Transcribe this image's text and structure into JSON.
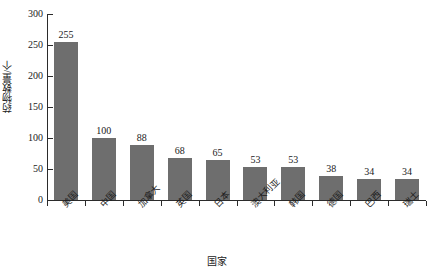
{
  "chart_data": {
    "type": "bar",
    "title": "",
    "xlabel": "国家",
    "ylabel": "药物数量/个",
    "categories": [
      "美国",
      "中国",
      "加拿大",
      "英国",
      "日本",
      "澳大利亚",
      "韩国",
      "德国",
      "巴西",
      "瑞士"
    ],
    "values": [
      255,
      100,
      88,
      68,
      65,
      53,
      53,
      38,
      34,
      34
    ],
    "ylim": [
      0,
      300
    ],
    "yticks": [
      0,
      50,
      100,
      150,
      200,
      250,
      300
    ],
    "ytick_labels": [
      "0",
      "50",
      "100",
      "150",
      "200",
      "250",
      "300"
    ],
    "grid": false,
    "legend": null,
    "bar_color": "#6e6e6e",
    "axis_color": "#2b2b2b",
    "background": "#ffffff",
    "value_labels_shown": true
  }
}
